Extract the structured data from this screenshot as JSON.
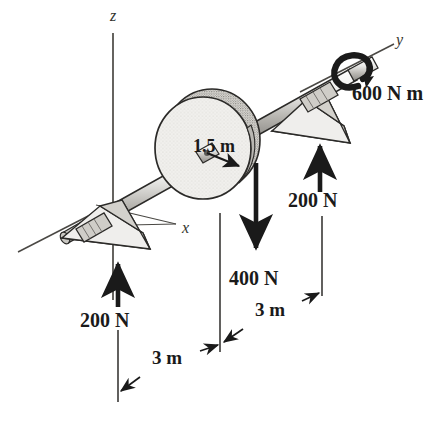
{
  "figure": {
    "type": "engineering-mechanics-diagram",
    "background_color": "#ffffff",
    "ink_color": "#1a1a1a",
    "shade_color": "#d8d6d2"
  },
  "axes": [
    {
      "id": "z",
      "label": "z",
      "orientation": "vertical-up",
      "x": 113,
      "y": 10
    },
    {
      "id": "y",
      "label": "y",
      "orientation": "up-right",
      "x": 398,
      "y": 36
    },
    {
      "id": "x",
      "label": "x",
      "orientation": "down-left",
      "x": 182,
      "y": 221
    }
  ],
  "forces": [
    {
      "id": "left-reaction",
      "label": "200 N",
      "magnitude": 200,
      "unit": "N",
      "direction": "up",
      "label_x": 80,
      "label_y": 310
    },
    {
      "id": "disk-load",
      "label": "400 N",
      "magnitude": 400,
      "unit": "N",
      "direction": "down",
      "label_x": 229,
      "label_y": 268
    },
    {
      "id": "right-reaction",
      "label": "200 N",
      "magnitude": 200,
      "unit": "N",
      "direction": "up",
      "label_x": 288,
      "label_y": 190
    }
  ],
  "moment": {
    "id": "applied-couple",
    "label": "600 N m",
    "magnitude": 600,
    "unit": "N m",
    "sense": "about-y-axis",
    "label_x": 352,
    "label_y": 83
  },
  "dimensions": [
    {
      "id": "dim-left",
      "label": "3 m",
      "value": 3,
      "unit": "m",
      "from": "left bearing",
      "to": "disk plane",
      "label_x": 152,
      "label_y": 348
    },
    {
      "id": "dim-right",
      "label": "3 m",
      "value": 3,
      "unit": "m",
      "from": "disk plane",
      "to": "right bearing",
      "label_x": 255,
      "label_y": 300
    },
    {
      "id": "dim-radius",
      "label": "1.5 m",
      "value": 1.5,
      "unit": "m",
      "from": "shaft center",
      "to": "disk rim",
      "label_x": 193,
      "label_y": 137
    }
  ],
  "components": [
    {
      "id": "shaft",
      "name": "shaft"
    },
    {
      "id": "disk",
      "name": "disk",
      "radius_label": "1.5 m"
    },
    {
      "id": "bearing-left",
      "name": "left bearing support"
    },
    {
      "id": "bearing-right",
      "name": "right bearing support"
    }
  ]
}
